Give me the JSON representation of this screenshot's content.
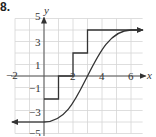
{
  "problem_number": "8.",
  "chart_data": {
    "type": "line",
    "title": "",
    "xlabel": "x",
    "ylabel": "y",
    "xlim": [
      -2,
      6.8
    ],
    "ylim": [
      -5,
      5
    ],
    "grid": true,
    "x_tick_labels": [
      "-2",
      "2",
      "4",
      "6"
    ],
    "y_tick_labels": [
      "5",
      "3",
      "1",
      "-1",
      "-3",
      "-5"
    ],
    "series": [
      {
        "name": "step function",
        "kind": "step",
        "segments": [
          {
            "x": [
              0,
              1
            ],
            "y": -2
          },
          {
            "x": [
              1,
              2
            ],
            "y": 0
          },
          {
            "x": [
              2,
              3
            ],
            "y": 2
          },
          {
            "x": [
              3,
              6.8
            ],
            "y": 4,
            "arrow": "right"
          }
        ]
      },
      {
        "name": "smooth S-curve",
        "kind": "curve",
        "points": [
          [
            -2,
            -4
          ],
          [
            0,
            -4
          ],
          [
            1,
            -3.4
          ],
          [
            2,
            -2
          ],
          [
            3,
            0
          ],
          [
            4,
            2
          ],
          [
            5,
            3.4
          ],
          [
            6,
            4
          ],
          [
            6.8,
            4
          ]
        ],
        "arrows": [
          "left",
          "right"
        ]
      }
    ]
  },
  "colors": {
    "grid": "#d6d6d6",
    "axis": "#555555",
    "curve": "#333333"
  }
}
